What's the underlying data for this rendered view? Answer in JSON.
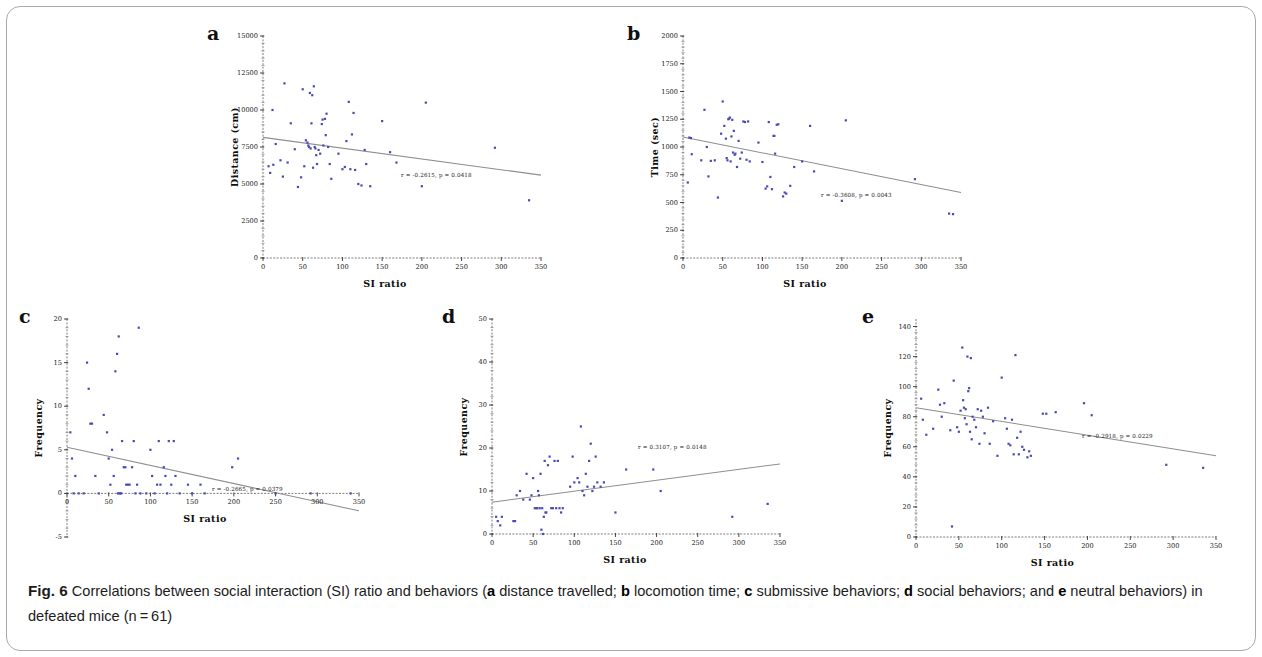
{
  "figure": {
    "caption_label": "Fig. 6",
    "caption_text_1": "Correlations between social interaction (SI) ratio and behaviors (",
    "caption_a": "a",
    "caption_text_2": " distance travelled; ",
    "caption_b": "b",
    "caption_text_3": " locomotion time; ",
    "caption_c": "c",
    "caption_text_4": " submissive behaviors; ",
    "caption_d": "d",
    "caption_text_5": " social behaviors; and ",
    "caption_e": "e",
    "caption_text_6": " neutral behaviors) in defeated mice (n = 61)",
    "point_color": "#4a4ab4",
    "line_color": "#8e8e8e",
    "axis_color": "#6f6f6f"
  },
  "chart_data": [
    {
      "id": "a",
      "panel_letter": "a",
      "type": "scatter",
      "title": "",
      "xlabel": "SI ratio",
      "ylabel": "Distance (cm)",
      "xlim": [
        0,
        350
      ],
      "ylim": [
        0,
        15000
      ],
      "xticks": [
        0,
        50,
        100,
        150,
        200,
        250,
        300,
        350
      ],
      "yticks": [
        0,
        2500,
        5000,
        7500,
        10000,
        12500,
        15000
      ],
      "grid": false,
      "annotation": "r = -0.2615, p = 0.0418",
      "annotation_r": -0.2615,
      "annotation_p": 0.0418,
      "fit_line": {
        "x0": 0,
        "y0": 8150,
        "x1": 350,
        "y1": 5600
      },
      "points": [
        [
          7,
          6200
        ],
        [
          9,
          5750
        ],
        [
          12,
          10000
        ],
        [
          13,
          6300
        ],
        [
          16,
          7700
        ],
        [
          22,
          6600
        ],
        [
          25,
          5500
        ],
        [
          27,
          11800
        ],
        [
          31,
          6450
        ],
        [
          35,
          9100
        ],
        [
          40,
          7350
        ],
        [
          44,
          4800
        ],
        [
          48,
          5450
        ],
        [
          50,
          11400
        ],
        [
          52,
          6200
        ],
        [
          54,
          7950
        ],
        [
          56,
          7800
        ],
        [
          57,
          7600
        ],
        [
          58,
          7500
        ],
        [
          59,
          11150
        ],
        [
          60,
          7400
        ],
        [
          61,
          9100
        ],
        [
          62,
          11000
        ],
        [
          63,
          6100
        ],
        [
          64,
          11600
        ],
        [
          65,
          7500
        ],
        [
          66,
          7400
        ],
        [
          67,
          6950
        ],
        [
          68,
          6350
        ],
        [
          70,
          7300
        ],
        [
          72,
          7050
        ],
        [
          74,
          9050
        ],
        [
          75,
          9350
        ],
        [
          76,
          7600
        ],
        [
          78,
          9400
        ],
        [
          79,
          8300
        ],
        [
          80,
          9750
        ],
        [
          82,
          7500
        ],
        [
          84,
          6350
        ],
        [
          86,
          5350
        ],
        [
          95,
          7050
        ],
        [
          100,
          6000
        ],
        [
          103,
          6150
        ],
        [
          105,
          7900
        ],
        [
          108,
          10550
        ],
        [
          110,
          6000
        ],
        [
          112,
          8350
        ],
        [
          114,
          9800
        ],
        [
          116,
          5950
        ],
        [
          120,
          5000
        ],
        [
          124,
          4900
        ],
        [
          128,
          7300
        ],
        [
          130,
          6350
        ],
        [
          135,
          4850
        ],
        [
          150,
          9250
        ],
        [
          160,
          7150
        ],
        [
          168,
          6450
        ],
        [
          200,
          4850
        ],
        [
          205,
          10500
        ],
        [
          292,
          7450
        ],
        [
          335,
          3900
        ]
      ]
    },
    {
      "id": "b",
      "panel_letter": "b",
      "type": "scatter",
      "title": "",
      "xlabel": "SI ratio",
      "ylabel": "Time (sec)",
      "xlim": [
        0,
        350
      ],
      "ylim": [
        0,
        2000
      ],
      "xticks": [
        0,
        50,
        100,
        150,
        200,
        250,
        300,
        350
      ],
      "yticks": [
        0,
        250,
        500,
        750,
        1000,
        1250,
        1500,
        1750,
        2000
      ],
      "grid": false,
      "annotation": "r = -0.3608, p = 0.0043",
      "annotation_r": -0.3608,
      "annotation_p": 0.0043,
      "fit_line": {
        "x0": 0,
        "y0": 1090,
        "x1": 350,
        "y1": 590
      },
      "points": [
        [
          6,
          680
        ],
        [
          8,
          1085
        ],
        [
          10,
          1080
        ],
        [
          11,
          935
        ],
        [
          23,
          880
        ],
        [
          27,
          1335
        ],
        [
          30,
          1000
        ],
        [
          32,
          735
        ],
        [
          35,
          875
        ],
        [
          40,
          880
        ],
        [
          44,
          545
        ],
        [
          48,
          1120
        ],
        [
          50,
          1410
        ],
        [
          52,
          1190
        ],
        [
          54,
          1075
        ],
        [
          55,
          900
        ],
        [
          56,
          880
        ],
        [
          57,
          1250
        ],
        [
          58,
          1255
        ],
        [
          59,
          1265
        ],
        [
          60,
          870
        ],
        [
          61,
          1095
        ],
        [
          62,
          1245
        ],
        [
          63,
          950
        ],
        [
          64,
          1145
        ],
        [
          65,
          930
        ],
        [
          66,
          940
        ],
        [
          68,
          820
        ],
        [
          70,
          1055
        ],
        [
          72,
          895
        ],
        [
          74,
          950
        ],
        [
          76,
          1230
        ],
        [
          78,
          1225
        ],
        [
          80,
          885
        ],
        [
          82,
          1230
        ],
        [
          84,
          870
        ],
        [
          95,
          1040
        ],
        [
          100,
          865
        ],
        [
          104,
          625
        ],
        [
          106,
          645
        ],
        [
          108,
          1225
        ],
        [
          110,
          730
        ],
        [
          112,
          620
        ],
        [
          114,
          1100
        ],
        [
          115,
          1100
        ],
        [
          116,
          940
        ],
        [
          118,
          1200
        ],
        [
          120,
          1205
        ],
        [
          126,
          555
        ],
        [
          128,
          590
        ],
        [
          130,
          580
        ],
        [
          135,
          650
        ],
        [
          140,
          820
        ],
        [
          150,
          870
        ],
        [
          160,
          1190
        ],
        [
          165,
          780
        ],
        [
          200,
          515
        ],
        [
          205,
          1240
        ],
        [
          292,
          710
        ],
        [
          335,
          400
        ],
        [
          340,
          395
        ]
      ]
    },
    {
      "id": "c",
      "panel_letter": "c",
      "type": "scatter",
      "title": "",
      "xlabel": "SI ratio",
      "ylabel": "Frequency",
      "xlim": [
        0,
        350
      ],
      "ylim": [
        -5,
        20
      ],
      "xticks": [
        0,
        50,
        100,
        150,
        200,
        250,
        300,
        350
      ],
      "yticks": [
        -5,
        0,
        5,
        10,
        15,
        20
      ],
      "grid": false,
      "annotation": "r = -0.2665, p = 0.0379",
      "annotation_r": -0.2665,
      "annotation_p": 0.0379,
      "fit_line": {
        "x0": 0,
        "y0": 5.3,
        "x1": 350,
        "y1": -2.0
      },
      "points": [
        [
          4,
          7
        ],
        [
          6,
          4
        ],
        [
          8,
          0
        ],
        [
          10,
          2
        ],
        [
          14,
          0
        ],
        [
          20,
          0
        ],
        [
          24,
          15
        ],
        [
          26,
          12
        ],
        [
          28,
          8
        ],
        [
          30,
          8
        ],
        [
          34,
          2
        ],
        [
          38,
          0
        ],
        [
          44,
          9
        ],
        [
          48,
          7
        ],
        [
          50,
          4
        ],
        [
          52,
          1
        ],
        [
          54,
          5
        ],
        [
          56,
          2
        ],
        [
          58,
          14
        ],
        [
          60,
          16
        ],
        [
          61,
          0
        ],
        [
          62,
          18
        ],
        [
          63,
          0
        ],
        [
          64,
          0
        ],
        [
          65,
          0
        ],
        [
          66,
          6
        ],
        [
          68,
          3
        ],
        [
          70,
          3
        ],
        [
          71,
          1
        ],
        [
          73,
          1
        ],
        [
          75,
          1
        ],
        [
          78,
          3
        ],
        [
          80,
          6
        ],
        [
          82,
          0
        ],
        [
          84,
          1
        ],
        [
          86,
          19
        ],
        [
          88,
          0
        ],
        [
          95,
          0
        ],
        [
          100,
          5
        ],
        [
          102,
          2
        ],
        [
          105,
          0
        ],
        [
          108,
          1
        ],
        [
          110,
          6
        ],
        [
          112,
          1
        ],
        [
          116,
          3
        ],
        [
          118,
          2
        ],
        [
          120,
          0
        ],
        [
          122,
          6
        ],
        [
          125,
          1
        ],
        [
          128,
          6
        ],
        [
          130,
          2
        ],
        [
          135,
          0
        ],
        [
          145,
          1
        ],
        [
          150,
          0
        ],
        [
          160,
          1
        ],
        [
          165,
          0
        ],
        [
          198,
          3
        ],
        [
          205,
          4
        ],
        [
          250,
          0
        ],
        [
          292,
          0
        ],
        [
          340,
          0
        ]
      ]
    },
    {
      "id": "d",
      "panel_letter": "d",
      "type": "scatter",
      "title": "",
      "xlabel": "SI ratio",
      "ylabel": "Frequency",
      "xlim": [
        0,
        350
      ],
      "ylim": [
        0,
        50
      ],
      "xticks": [
        0,
        50,
        100,
        150,
        200,
        250,
        300,
        350
      ],
      "yticks": [
        0,
        10,
        20,
        30,
        40,
        50
      ],
      "grid": false,
      "annotation": "r = 0.3107, p = 0.0148",
      "annotation_r": 0.3107,
      "annotation_p": 0.0148,
      "fit_line": {
        "x0": 0,
        "y0": 7.4,
        "x1": 350,
        "y1": 16.3
      },
      "points": [
        [
          5,
          4
        ],
        [
          7,
          3
        ],
        [
          10,
          2
        ],
        [
          12,
          4
        ],
        [
          26,
          3
        ],
        [
          28,
          3
        ],
        [
          30,
          9
        ],
        [
          34,
          10
        ],
        [
          38,
          8
        ],
        [
          42,
          14
        ],
        [
          46,
          8
        ],
        [
          48,
          9
        ],
        [
          50,
          13
        ],
        [
          52,
          6
        ],
        [
          54,
          6
        ],
        [
          55,
          6
        ],
        [
          56,
          10
        ],
        [
          57,
          9
        ],
        [
          58,
          6
        ],
        [
          59,
          14
        ],
        [
          60,
          1
        ],
        [
          61,
          6
        ],
        [
          62,
          0
        ],
        [
          63,
          4
        ],
        [
          64,
          17
        ],
        [
          65,
          5
        ],
        [
          66,
          5
        ],
        [
          68,
          16
        ],
        [
          70,
          18
        ],
        [
          72,
          6
        ],
        [
          74,
          6
        ],
        [
          76,
          17
        ],
        [
          78,
          6
        ],
        [
          80,
          17
        ],
        [
          82,
          6
        ],
        [
          84,
          5
        ],
        [
          86,
          6
        ],
        [
          95,
          11
        ],
        [
          98,
          18
        ],
        [
          100,
          12
        ],
        [
          104,
          13
        ],
        [
          106,
          12
        ],
        [
          108,
          25
        ],
        [
          110,
          10
        ],
        [
          112,
          9
        ],
        [
          114,
          14
        ],
        [
          116,
          11
        ],
        [
          118,
          17
        ],
        [
          120,
          21
        ],
        [
          122,
          10
        ],
        [
          124,
          11
        ],
        [
          126,
          18
        ],
        [
          128,
          12
        ],
        [
          132,
          11
        ],
        [
          136,
          12
        ],
        [
          150,
          5
        ],
        [
          163,
          15
        ],
        [
          196,
          15
        ],
        [
          205,
          10
        ],
        [
          292,
          4
        ],
        [
          335,
          7
        ]
      ]
    },
    {
      "id": "e",
      "panel_letter": "e",
      "type": "scatter",
      "title": "",
      "xlabel": "SI ratio",
      "ylabel": "Frequency",
      "xlim": [
        0,
        350
      ],
      "ylim": [
        0,
        145
      ],
      "xticks": [
        0,
        50,
        100,
        150,
        200,
        250,
        300,
        350
      ],
      "yticks": [
        0,
        20,
        40,
        60,
        80,
        100,
        120,
        140
      ],
      "grid": false,
      "annotation": "r = -0.2918, p = 0.0229",
      "annotation_r": -0.2918,
      "annotation_p": 0.0229,
      "fit_line": {
        "x0": 0,
        "y0": 86,
        "x1": 350,
        "y1": 54
      },
      "points": [
        [
          6,
          92
        ],
        [
          8,
          78
        ],
        [
          12,
          68
        ],
        [
          26,
          98
        ],
        [
          28,
          88
        ],
        [
          30,
          80
        ],
        [
          33,
          89
        ],
        [
          40,
          71
        ],
        [
          42,
          7
        ],
        [
          44,
          104
        ],
        [
          48,
          73
        ],
        [
          50,
          70
        ],
        [
          52,
          84
        ],
        [
          54,
          126
        ],
        [
          55,
          91
        ],
        [
          56,
          86
        ],
        [
          57,
          79
        ],
        [
          58,
          85
        ],
        [
          59,
          75
        ],
        [
          60,
          120
        ],
        [
          61,
          97
        ],
        [
          62,
          99
        ],
        [
          63,
          70
        ],
        [
          64,
          119
        ],
        [
          65,
          65
        ],
        [
          66,
          80
        ],
        [
          68,
          78
        ],
        [
          70,
          73
        ],
        [
          72,
          85
        ],
        [
          74,
          62
        ],
        [
          76,
          84
        ],
        [
          78,
          80
        ],
        [
          80,
          69
        ],
        [
          84,
          86
        ],
        [
          86,
          62
        ],
        [
          95,
          54
        ],
        [
          100,
          106
        ],
        [
          104,
          79
        ],
        [
          106,
          72
        ],
        [
          108,
          62
        ],
        [
          110,
          61
        ],
        [
          112,
          78
        ],
        [
          114,
          55
        ],
        [
          116,
          121
        ],
        [
          118,
          66
        ],
        [
          120,
          55
        ],
        [
          122,
          70
        ],
        [
          124,
          60
        ],
        [
          126,
          58
        ],
        [
          130,
          53
        ],
        [
          132,
          57
        ],
        [
          134,
          54
        ],
        [
          148,
          82
        ],
        [
          152,
          82
        ],
        [
          163,
          83
        ],
        [
          196,
          89
        ],
        [
          205,
          81
        ],
        [
          292,
          48
        ],
        [
          335,
          46
        ],
        [
          20,
          72
        ],
        [
          90,
          77
        ]
      ]
    }
  ]
}
